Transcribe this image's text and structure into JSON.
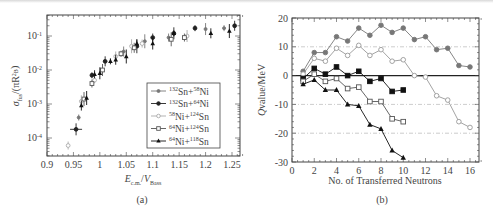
{
  "figure": {
    "caption_a": "(a)",
    "caption_b": "(b)"
  },
  "chart_data": [
    {
      "type": "scatter",
      "panel": "(a)",
      "title": "",
      "xlabel": "E_c.m./V_Bass",
      "ylabel": "σ_fus/(πR_B²)",
      "xscale": "linear",
      "yscale": "log",
      "xlim": [
        0.9,
        1.27
      ],
      "ylim": [
        3e-05,
        0.3
      ],
      "x_ticks": [
        "0.9",
        "0.95",
        "1",
        "1.05",
        "1.1",
        "1.15",
        "1.2",
        "1.25"
      ],
      "y_ticks": [
        "10^-4",
        "10^-3",
        "10^-2",
        "10^-1"
      ],
      "legend_position": "lower right",
      "legend": [
        "132Sn+58Ni",
        "132Sn+64Ni",
        "58Ni+124Sn",
        "64Ni+124Sn",
        "64Ni+118Sn"
      ],
      "series": [
        {
          "name": "132Sn+58Ni",
          "marker": "small-filled-circle",
          "color": "#777777",
          "points": [
            [
              0.96,
              0.0004
            ],
            [
              1.045,
              0.035
            ],
            [
              1.085,
              0.07
            ],
            [
              1.13,
              0.09
            ],
            [
              1.2,
              0.16
            ],
            [
              1.235,
              0.17
            ]
          ]
        },
        {
          "name": "132Sn+64Ni",
          "marker": "filled-circle",
          "color": "#222222",
          "points": [
            [
              0.955,
              0.00018
            ],
            [
              0.985,
              0.007
            ],
            [
              1.01,
              0.018
            ],
            [
              1.07,
              0.05
            ],
            [
              1.1,
              0.09
            ],
            [
              1.14,
              0.12
            ],
            [
              1.18,
              0.17
            ],
            [
              1.255,
              0.2
            ]
          ]
        },
        {
          "name": "58Ni+124Sn",
          "marker": "open-circle-gray",
          "color": "#aaaaaa",
          "points": [
            [
              0.94,
              6e-05
            ],
            [
              0.965,
              0.0012
            ],
            [
              0.99,
              0.005
            ],
            [
              1.03,
              0.025
            ],
            [
              1.06,
              0.05
            ],
            [
              1.08,
              0.06
            ],
            [
              1.165,
              0.1
            ]
          ]
        },
        {
          "name": "64Ni+124Sn",
          "marker": "open-square",
          "color": "#555555",
          "points": [
            [
              0.97,
              0.0014
            ],
            [
              0.985,
              0.004
            ],
            [
              1.005,
              0.01
            ],
            [
              1.04,
              0.03
            ],
            [
              1.065,
              0.045
            ],
            [
              1.135,
              0.08
            ],
            [
              1.16,
              0.09
            ]
          ]
        },
        {
          "name": "64Ni+118Sn",
          "marker": "filled-triangle",
          "color": "#111111",
          "points": [
            [
              0.965,
              0.0009
            ],
            [
              0.975,
              0.0015
            ],
            [
              0.99,
              0.0075
            ],
            [
              1.0,
              0.008
            ],
            [
              1.02,
              0.018
            ],
            [
              1.03,
              0.02
            ],
            [
              1.05,
              0.025
            ],
            [
              1.07,
              0.06
            ],
            [
              1.1,
              0.06
            ],
            [
              1.14,
              0.12
            ],
            [
              1.21,
              0.12
            ],
            [
              1.245,
              0.14
            ]
          ]
        }
      ]
    },
    {
      "type": "line",
      "panel": "(b)",
      "title": "",
      "xlabel": "No. of Transferred Neutrons",
      "ylabel": "Qvalue/MeV",
      "xlim": [
        0,
        17
      ],
      "ylim": [
        -30,
        20
      ],
      "x_ticks": [
        "0",
        "2",
        "4",
        "6",
        "8",
        "10",
        "12",
        "14",
        "16"
      ],
      "y_ticks": [
        "20",
        "10",
        "0",
        "-10",
        "-20",
        "-30"
      ],
      "grid": "dashed horizontal at 10, -10, -20; solid zero line",
      "series": [
        {
          "name": "series-1",
          "marker": "filled-circle",
          "color": "#777777",
          "x": [
            1,
            2,
            3,
            4,
            5,
            6,
            7,
            8,
            9,
            10,
            11,
            12,
            13,
            14,
            15,
            16
          ],
          "values": [
            1.5,
            8,
            8,
            13.5,
            12,
            16.5,
            14,
            17.5,
            15,
            16.5,
            12.5,
            13.5,
            9,
            9.5,
            3.5,
            3
          ]
        },
        {
          "name": "series-2",
          "marker": "open-circle",
          "color": "#999999",
          "x": [
            1,
            2,
            3,
            4,
            5,
            6,
            7,
            8,
            9,
            10,
            11,
            12,
            13,
            14,
            15,
            16
          ],
          "values": [
            0.5,
            6,
            5,
            9.5,
            7,
            10.5,
            7,
            9,
            5,
            5.5,
            0,
            -0.5,
            -7,
            -8.5,
            -16,
            -18
          ]
        },
        {
          "name": "series-3",
          "marker": "filled-square",
          "color": "#111111",
          "x": [
            1,
            2,
            3,
            4,
            5,
            6,
            7,
            8,
            9,
            10
          ],
          "values": [
            -1,
            2.5,
            0.5,
            3,
            0,
            1.5,
            -2,
            -1,
            -5.5,
            -5
          ]
        },
        {
          "name": "series-4",
          "marker": "open-square",
          "color": "#555555",
          "x": [
            1,
            2,
            3,
            4,
            5,
            6,
            7,
            8,
            9,
            10
          ],
          "values": [
            -2,
            0.5,
            -2,
            -1,
            -4.5,
            -4,
            -9,
            -9,
            -15,
            -16
          ]
        },
        {
          "name": "series-5",
          "marker": "filled-triangle",
          "color": "#111111",
          "x": [
            1,
            2,
            3,
            4,
            5,
            6,
            7,
            8,
            9,
            10
          ],
          "values": [
            -3,
            -1.5,
            -5,
            -5,
            -10,
            -10.5,
            -17,
            -18.5,
            -26,
            -28.5
          ]
        }
      ]
    }
  ]
}
